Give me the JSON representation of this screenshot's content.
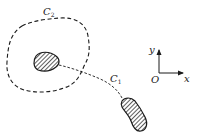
{
  "diagram": {
    "curves": [
      {
        "id": "C2",
        "label": "C",
        "subscript": "2",
        "style": "dashed",
        "shape": "closed-loop"
      },
      {
        "id": "C1",
        "label": "C",
        "subscript": "1",
        "style": "dashed",
        "shape": "open-arc"
      }
    ],
    "bodies": [
      {
        "id": "inner-body",
        "fill": "hatched"
      },
      {
        "id": "outer-body",
        "fill": "hatched"
      }
    ],
    "axes": {
      "x_label": "x",
      "y_label": "y",
      "origin_label": "O"
    },
    "colors": {
      "stroke": "#1a1a1a",
      "background": "#ffffff"
    }
  }
}
